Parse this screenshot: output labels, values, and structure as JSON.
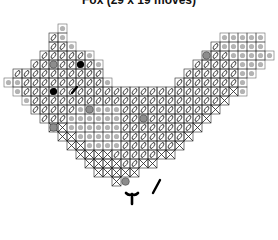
{
  "title": "Fox (29 x 19 moves)",
  "colors": {
    "grid": "#222222",
    "shade": "#9a9a9a",
    "gray_dot": "#8c8c8c",
    "black": "#000000"
  },
  "grid": {
    "origin_x": 4,
    "origin_y": 24,
    "cell": 9,
    "cols": 30,
    "rows": 20
  },
  "cells": {
    "legend": "S = stitched cell (loop symbol), X = crossed cell, G = shaded/gray cell",
    "rows": [
      "......G.......................",
      ".....SG.................GGGGG.",
      ".....SSG...............SGGGGG.",
      "....SSSSSG............SSSGGGGG",
      "...SSSSSSSG..........SSSSSGGG.",
      ".SSSSSSSSSS.........SSSSSSGG..",
      "GGSSSSSSSSSG.......SSSSSSSG...",
      ".GSSSSSSSSSSSSSSSSSSSSSSSXG...",
      "..GSSSSSSSSSSSSSSSSSSSSSX.....",
      "...SSSSSGGGGGSSSSSSSSSSX......",
      "....SSSGGGGGGSSSSSSSSSX.......",
      ".....XXGGGGGGSSSSSSSSX........",
      "......XXGGGGGSSSSSSSX.........",
      ".......XXGGGGSSSSSSX..........",
      "........XXXXSSSSSXX...........",
      ".........XXXXSSXX.............",
      "..........XXXXX...............",
      "............X.................",
      ".............................."
    ]
  },
  "markers": [
    {
      "type": "gray-dot",
      "col": 5,
      "row": 4
    },
    {
      "type": "black-dot",
      "col": 8,
      "row": 4
    },
    {
      "type": "black-dot",
      "col": 5,
      "row": 7
    },
    {
      "type": "gray-dot",
      "col": 5,
      "row": 11
    },
    {
      "type": "gray-dot",
      "col": 22,
      "row": 3
    },
    {
      "type": "gray-dot",
      "col": 15,
      "row": 10
    },
    {
      "type": "gray-dot",
      "col": 13,
      "row": 17
    },
    {
      "type": "gray-dot",
      "col": 9,
      "row": 9
    }
  ],
  "strokes": [
    {
      "name": "nose-mark",
      "x1": 72,
      "y1": 93,
      "x2": 77,
      "y2": 87
    },
    {
      "name": "tail-tip-mark",
      "x1": 153,
      "y1": 193,
      "x2": 160,
      "y2": 180
    }
  ],
  "paws": [
    {
      "x": 132,
      "y": 196
    }
  ]
}
